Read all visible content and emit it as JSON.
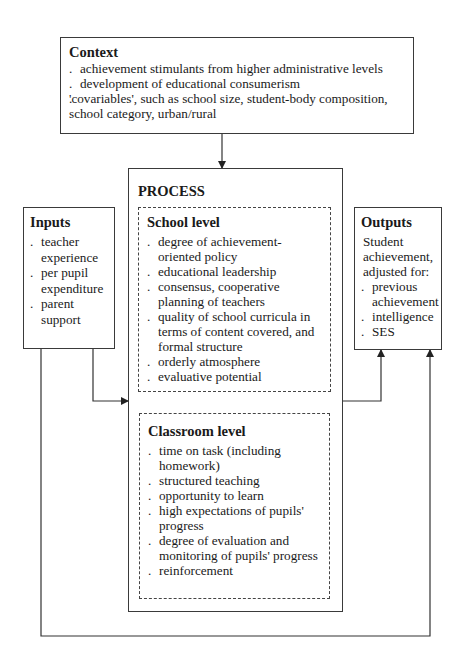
{
  "context": {
    "title": "Context",
    "items": [
      "achievement stimulants from higher administrative levels",
      "development of educational consumerism",
      "'covariables', such as school size, student-body composition, school category, urban/rural"
    ]
  },
  "inputs": {
    "title": "Inputs",
    "items": [
      "teacher experience",
      "per pupil expenditure",
      "parent support"
    ]
  },
  "process": {
    "title": "PROCESS",
    "school_level": {
      "title": "School level",
      "items": [
        "degree of achievement-oriented policy",
        "educational leadership",
        "consensus, cooperative planning of teachers",
        "quality of school curricula in terms of content covered, and formal structure",
        "orderly atmosphere",
        "evaluative potential"
      ]
    },
    "classroom_level": {
      "title": "Classroom level",
      "items": [
        "time on task (including homework)",
        "structured teaching",
        "opportunity to learn",
        "high expectations of pupils' progress",
        "degree of evaluation and monitoring of pupils' progress",
        "reinforcement"
      ]
    }
  },
  "outputs": {
    "title": "Outputs",
    "intro": "Student achievement, adjusted for:",
    "items": [
      "previous achievement",
      "intelligence",
      "SES"
    ]
  }
}
